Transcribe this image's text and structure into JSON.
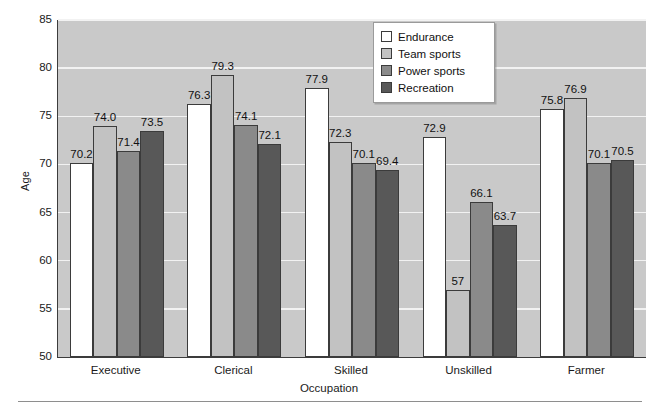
{
  "chart_data": {
    "type": "bar",
    "title": "",
    "xlabel": "Occupation",
    "ylabel": "Age",
    "ylim": [
      50,
      85
    ],
    "yticks": [
      50,
      55,
      60,
      65,
      70,
      75,
      80,
      85
    ],
    "ytick_labels": [
      "50",
      "55",
      "60",
      "65",
      "70",
      "75",
      "80",
      "85"
    ],
    "grid": true,
    "legend_position": "upper-center",
    "categories": [
      "Executive",
      "Clerical",
      "Skilled",
      "Unskilled",
      "Farmer"
    ],
    "series": [
      {
        "name": "Endurance",
        "color": "#ffffff",
        "values": [
          70.2,
          76.3,
          77.9,
          72.9,
          75.8
        ],
        "labels": [
          "70.2",
          "76.3",
          "77.9",
          "72.9",
          "75.8"
        ]
      },
      {
        "name": "Team sports",
        "color": "#c2c2c2",
        "values": [
          74.0,
          79.3,
          72.3,
          57.0,
          76.9
        ],
        "labels": [
          "74.0",
          "79.3",
          "72.3",
          "57",
          "76.9"
        ]
      },
      {
        "name": "Power sports",
        "color": "#8a8a8a",
        "values": [
          71.4,
          74.1,
          70.1,
          66.1,
          70.1
        ],
        "labels": [
          "71.4",
          "74.1",
          "70.1",
          "66.1",
          "70.1"
        ]
      },
      {
        "name": "Recreation",
        "color": "#585858",
        "values": [
          73.5,
          72.1,
          69.4,
          63.7,
          70.5
        ],
        "labels": [
          "73.5",
          "72.1",
          "69.4",
          "63.7",
          "70.5"
        ]
      }
    ]
  },
  "legend": {
    "items": [
      {
        "label": "Endurance"
      },
      {
        "label": "Team sports"
      },
      {
        "label": "Power sports"
      },
      {
        "label": "Recreation"
      }
    ]
  },
  "colors": {
    "plot_background": "#c9c9c9",
    "gridline": "#f2f2f2",
    "axis": "#3c3c3c",
    "text": "#1a1a1a",
    "series_endurance": "#ffffff",
    "series_team_sports": "#c2c2c2",
    "series_power_sports": "#8a8a8a",
    "series_recreation": "#585858"
  }
}
